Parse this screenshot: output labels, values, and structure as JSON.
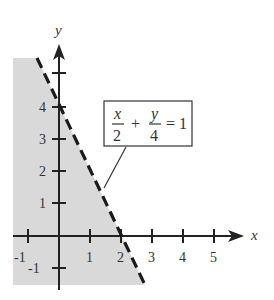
{
  "diagram": {
    "type": "linear-inequality-graph",
    "axes": {
      "x_label": "x",
      "y_label": "y",
      "x_ticks": [
        "-1",
        "1",
        "2",
        "3",
        "4",
        "5"
      ],
      "y_ticks": [
        "-1",
        "1",
        "2",
        "3",
        "4"
      ]
    },
    "equation": {
      "x_numerator": "x",
      "x_denominator": "2",
      "plus": "+",
      "y_numerator": "y",
      "y_denominator": "4",
      "equals": "= 1"
    },
    "boundary": {
      "style": "dashed",
      "x_intercept": 2,
      "y_intercept": 4
    },
    "shaded_region": "below-left of line",
    "colors": {
      "shade": "#d9d9d9",
      "line": "#1a1a1a",
      "axis": "#222222"
    }
  }
}
